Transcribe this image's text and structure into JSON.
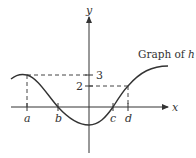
{
  "diagram": {
    "title": "Graph of h",
    "function_name": "h",
    "axes": {
      "x_label": "x",
      "y_label": "y"
    },
    "x_points": [
      {
        "label": "a",
        "px": 27
      },
      {
        "label": "b",
        "px": 58
      },
      {
        "label": "c",
        "px": 113
      },
      {
        "label": "d",
        "px": 128
      }
    ],
    "y_levels": [
      {
        "label": "3",
        "value": 3
      },
      {
        "label": "2",
        "value": 2
      }
    ],
    "annotations": [
      "h(a) = 3 (local maximum at x = a)",
      "h(b) = 0",
      "h(c) = 0",
      "h(d) = 2",
      "minimum near x = 0"
    ],
    "colors": {
      "curve": "#333333",
      "axes": "#333333",
      "dashed": "#444444"
    }
  }
}
